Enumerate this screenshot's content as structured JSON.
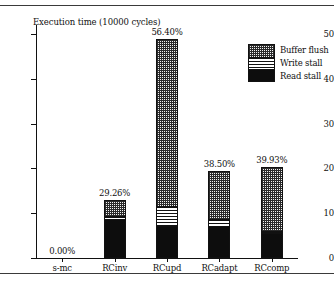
{
  "chart_data": {
    "type": "bar",
    "subtype": "stacked-bar",
    "title": "Execution time (10000 cycles)",
    "xlabel": "",
    "ylabel": "",
    "ylim": [
      0,
      52
    ],
    "yticks": [
      0,
      10,
      20,
      30,
      40,
      50
    ],
    "ytick_labels": [
      "0",
      "10",
      "20",
      "30",
      "40",
      "50"
    ],
    "grid": false,
    "legend_position": "top-right",
    "categories": [
      "s-mc",
      "RCinv",
      "RCupd",
      "RCadapt",
      "RCcomp"
    ],
    "series": [
      {
        "name": "Read stall",
        "pattern": "solid-black",
        "values": [
          0,
          9.1,
          7.5,
          7.6,
          6.0
        ]
      },
      {
        "name": "Write stall",
        "pattern": "horizontal-lines",
        "values": [
          0,
          0.5,
          4.4,
          1.3,
          0.3
        ]
      },
      {
        "name": "Buffer flush",
        "pattern": "cross-hatch-grid",
        "values": [
          0,
          3.4,
          36.9,
          10.6,
          14.1
        ]
      }
    ],
    "totals": [
      0,
      13.0,
      48.8,
      19.5,
      20.4
    ],
    "annotations": [
      {
        "category": "s-mc",
        "label": "0.00%"
      },
      {
        "category": "RCinv",
        "label": "29.26%"
      },
      {
        "category": "RCupd",
        "label": "56.40%"
      },
      {
        "category": "RCadapt",
        "label": "38.50%"
      },
      {
        "category": "RCcomp",
        "label": "39.93%"
      }
    ]
  },
  "legend": {
    "items": [
      {
        "label": "Buffer flush",
        "pattern": "cross-hatch-grid"
      },
      {
        "label": "Write stall",
        "pattern": "horizontal-lines"
      },
      {
        "label": "Read stall",
        "pattern": "solid-black"
      }
    ]
  },
  "colors": {
    "ink": "#111111",
    "read_stall": "#0d0d0d",
    "flush_fill": "#f2f2f2",
    "background": "#ffffff"
  }
}
